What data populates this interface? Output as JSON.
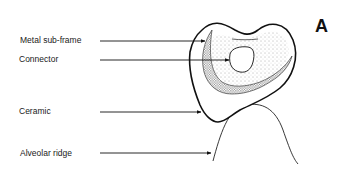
{
  "figure": {
    "panel_label": "A",
    "labels": [
      {
        "id": "metal-sub-frame",
        "text": "Metal sub-frame"
      },
      {
        "id": "connector",
        "text": "Connector"
      },
      {
        "id": "ceramic",
        "text": "Ceramic"
      },
      {
        "id": "alveolar-ridge",
        "text": "Alveolar ridge"
      }
    ],
    "colors": {
      "ink": "#111111",
      "background": "#ffffff",
      "stipple": "#555555"
    }
  }
}
